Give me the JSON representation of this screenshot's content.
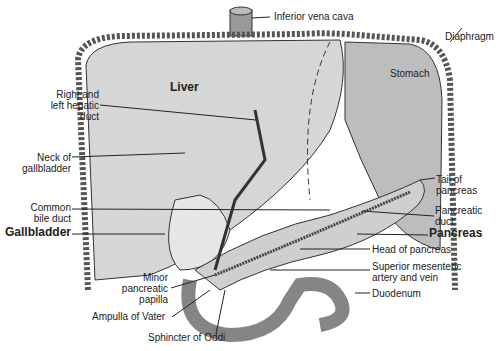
{
  "diagram": {
    "organs": [
      "Liver",
      "Stomach"
    ],
    "labels": {
      "ivc": "Inferior vena cava",
      "diaphragm": "Diaphragm",
      "liver": "Liver",
      "stomach": "Stomach",
      "hepatic_duct": "Right and\nleft hepatic\nduct",
      "neck_gb": "Neck of\ngallbladder",
      "cbd": "Common\nbile duct",
      "gallbladder": "Gallbladder",
      "minor_papilla": "Minor\npancreatic\npapilla",
      "ampulla": "Ampulla of Vater",
      "sphincter": "Sphincter of Oddi",
      "tail": "Tail of\npancreas",
      "pduct": "Pancreatic\nduct",
      "pancreas": "Pancreas",
      "head": "Head of pancreas",
      "sma": "Superior mesenteric\nartery and vein",
      "duodenum": "Duodenum"
    },
    "colors": {
      "tissue": "#c8c8c8",
      "outline": "#333333",
      "diaphragm": "#8a8a8a"
    }
  }
}
